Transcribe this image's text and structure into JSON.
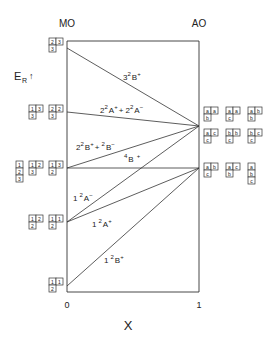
{
  "axes": {
    "left_label": "MO",
    "right_label": "AO",
    "x_label": "X",
    "x_tick_left": "0",
    "x_tick_right": "1",
    "y_label_main": "E",
    "y_label_sub": "R",
    "y_arrow": "↑"
  },
  "chart_data": {
    "type": "correlation-diagram",
    "title": "",
    "xlabel": "X",
    "ylabel": "E_R",
    "xlim": [
      0,
      1
    ],
    "states": [
      {
        "name": "3²B⁺",
        "label_main": "3",
        "label_sup1": "2",
        "label_sym": "B",
        "label_sup2": "+",
        "mo_level": 48,
        "ao_level": 126
      },
      {
        "name": "2²A⁺ + 2²A⁻",
        "label_main": "2",
        "label_sup1": "2",
        "label_sym": "A",
        "label_sup2": "+",
        "label_plus": "+ 2",
        "label_sup3": "2",
        "label_sym2": "A",
        "label_sup4": "−",
        "mo_level": 112,
        "ao_level": 126
      },
      {
        "name": "2²B⁺ + ²B⁻",
        "label_main": "2",
        "label_sup1": "2",
        "label_sym": "B",
        "label_sup2": "+",
        "label_plus": "+ ",
        "label_sup3": "2",
        "label_sym2": "B",
        "label_sup4": "−",
        "mo_level": 168,
        "ao_level": 126
      },
      {
        "name": "⁴B⁺",
        "label_main": "",
        "label_sup1": "4",
        "label_sym": "B",
        "label_sup2": "+",
        "mo_level": 168,
        "ao_level": 168
      },
      {
        "name": "1²A⁻",
        "label_main": "1",
        "label_sup1": "2",
        "label_sym": "A",
        "label_sup2": "−",
        "mo_level": 222,
        "ao_level": 126
      },
      {
        "name": "1²A⁺",
        "label_main": "1",
        "label_sup1": "2",
        "label_sym": "A",
        "label_sup2": "+",
        "mo_level": 222,
        "ao_level": 168
      },
      {
        "name": "1²B⁺",
        "label_main": "1",
        "label_sup1": "2",
        "label_sym": "B",
        "label_sup2": "+",
        "mo_level": 286,
        "ao_level": 168
      }
    ]
  },
  "mo_tableaux": [
    {
      "level": 48,
      "items": [
        {
          "rows": [
            [
              "2",
              "3"
            ],
            [
              "3"
            ]
          ]
        }
      ]
    },
    {
      "level": 112,
      "items": [
        {
          "rows": [
            [
              "1",
              "3"
            ],
            [
              "3"
            ]
          ]
        },
        {
          "rows": [
            [
              "2",
              "2"
            ],
            [
              "3"
            ]
          ]
        }
      ]
    },
    {
      "level": 168,
      "items": [
        {
          "rows": [
            [
              "1"
            ],
            [
              "2"
            ],
            [
              "3"
            ]
          ]
        },
        {
          "rows": [
            [
              "1",
              "2"
            ],
            [
              "3"
            ]
          ]
        },
        {
          "rows": [
            [
              "1",
              "3"
            ],
            [
              "2"
            ]
          ]
        }
      ]
    },
    {
      "level": 222,
      "items": [
        {
          "rows": [
            [
              "1",
              "2"
            ],
            [
              "2"
            ]
          ]
        },
        {
          "rows": [
            [
              "1",
              "1"
            ],
            [
              "2"
            ]
          ]
        }
      ]
    },
    {
      "level": 286,
      "items": [
        {
          "rows": [
            [
              "1",
              "1"
            ],
            [
              "2"
            ]
          ]
        }
      ]
    }
  ],
  "ao_tableaux": [
    {
      "level": 107,
      "items": [
        {
          "rows": [
            [
              "a",
              "a"
            ],
            [
              "b"
            ]
          ]
        },
        {
          "rows": [
            [
              "a",
              "a"
            ],
            [
              "c"
            ]
          ]
        },
        {
          "rows": [
            [
              "a",
              "b"
            ],
            [
              "b"
            ]
          ]
        }
      ]
    },
    {
      "level": 129,
      "items": [
        {
          "rows": [
            [
              "a",
              "c"
            ],
            [
              "c"
            ]
          ]
        },
        {
          "rows": [
            [
              "b",
              "b"
            ],
            [
              "c"
            ]
          ]
        },
        {
          "rows": [
            [
              "b",
              "c"
            ],
            [
              "c"
            ]
          ]
        }
      ]
    },
    {
      "level": 163,
      "items": [
        {
          "rows": [
            [
              "a",
              "b"
            ],
            [
              "c"
            ]
          ]
        },
        {
          "rows": [
            [
              "a",
              "c"
            ],
            [
              "b"
            ]
          ]
        },
        {
          "rows": [
            [
              "a"
            ],
            [
              "b"
            ],
            [
              "c"
            ]
          ]
        }
      ]
    }
  ]
}
